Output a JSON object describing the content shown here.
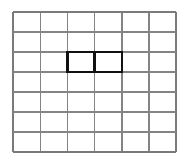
{
  "figure": {
    "background_color": "#ffffff",
    "grid": {
      "columns": 6,
      "rows": 7,
      "origin_x": 13,
      "origin_y": 12,
      "cell_width": 27.2,
      "cell_height": 20,
      "line_color": "#848484",
      "line_width": 1.4,
      "outer_line_color": "#7a7a7a",
      "outer_line_width": 1.6
    },
    "highlight": {
      "label": "bold-outlined domino",
      "line_color": "#111111",
      "line_width": 2.6,
      "start_column": 3,
      "end_column": 4,
      "row": 3,
      "cell_count": 2,
      "divider_visible": true,
      "fill": "none"
    }
  }
}
